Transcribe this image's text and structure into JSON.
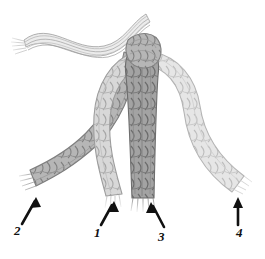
{
  "figure": {
    "background_color": "#ffffff",
    "outline_color": "#6e6e6e",
    "ink_color": "#111111"
  },
  "callouts": [
    {
      "id": "callout-1",
      "label": "1",
      "label_x": 94,
      "label_y": 228,
      "arrow": {
        "x1": 101,
        "y1": 225,
        "x2": 113,
        "y2": 204,
        "direction": "up-right"
      },
      "points_to": "strand-1"
    },
    {
      "id": "callout-2",
      "label": "2",
      "label_x": 14,
      "label_y": 228,
      "arrow": {
        "x1": 22,
        "y1": 224,
        "x2": 36,
        "y2": 199,
        "direction": "up-right"
      },
      "points_to": "strand-2"
    },
    {
      "id": "callout-3",
      "label": "3",
      "label_x": 158,
      "label_y": 231,
      "arrow": {
        "x1": 163,
        "y1": 227,
        "x2": 152,
        "y2": 204,
        "direction": "up-left"
      },
      "points_to": "strand-3"
    },
    {
      "id": "callout-4",
      "label": "4",
      "label_x": 237,
      "label_y": 228,
      "arrow": {
        "x1": 238,
        "y1": 224,
        "x2": 238,
        "y2": 200,
        "direction": "up"
      },
      "points_to": "strand-4"
    }
  ],
  "strands": [
    {
      "id": "strand-1",
      "name": "strand-1",
      "tone": "light",
      "color": "#d2d2d2",
      "stroke": "#9a9a9a",
      "path_hint": "from knot, arcs left then descends vertically to lower-centre-left, frayed end"
    },
    {
      "id": "strand-2",
      "name": "strand-2",
      "tone": "medium-dark",
      "color": "#a9a9a9",
      "stroke": "#7c7c7c",
      "path_hint": "from knot, crosses down-left diagonally to lower-left, frayed end"
    },
    {
      "id": "strand-3",
      "name": "strand-3",
      "tone": "dark",
      "color": "#9b9b9b",
      "stroke": "#6f6f6f",
      "path_hint": "from knot, descends vertically through centre, frayed end"
    },
    {
      "id": "strand-4",
      "name": "strand-4",
      "tone": "lightest",
      "color": "#dedede",
      "stroke": "#b0b0b0",
      "path_hint": "from knot, arcs right then sweeps down-right, frayed end"
    }
  ],
  "tail": {
    "id": "loose-tail",
    "name": "loose-unbraided-tail",
    "description": "loose parallel unbraided fibres sweeping to the upper left in an S-curve",
    "color": "#e3e3e3",
    "stroke": "#a5a5a5"
  },
  "knot": {
    "id": "knot-junction",
    "name": "knot-junction",
    "description": "convergence point at top where the loose tail gathers into the four braids",
    "x": 145,
    "y": 48
  }
}
